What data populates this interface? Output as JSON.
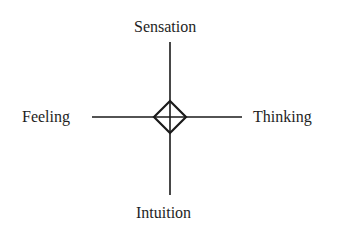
{
  "diagram": {
    "type": "cross-diagram",
    "center_symbol": "diamond-with-cross",
    "labels": {
      "top": "Sensation",
      "left": "Feeling",
      "right": "Thinking",
      "bottom": "Intuition"
    },
    "colors": {
      "line": "#1a1a1a",
      "text": "#1e1e1e",
      "background": "#ffffff"
    }
  }
}
